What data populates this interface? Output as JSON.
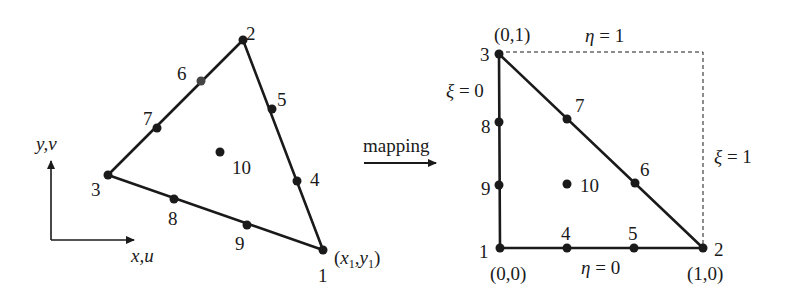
{
  "diagram": {
    "colors": {
      "ink": "#1a1a1a",
      "background": "#ffffff"
    },
    "physical_element": {
      "axes": {
        "y_label": "y,v",
        "x_label": "x,u"
      },
      "corner_label": {
        "prefix": "(",
        "x": "x",
        "x_sub": "1",
        "sep": ",",
        "y": "y",
        "y_sub": "1",
        "suffix": ")"
      },
      "nodes": [
        {
          "id": "1",
          "label": "1",
          "x": 323,
          "y": 250
        },
        {
          "id": "2",
          "label": "2",
          "x": 243,
          "y": 40
        },
        {
          "id": "3",
          "label": "3",
          "x": 108,
          "y": 175
        },
        {
          "id": "4",
          "label": "4",
          "x": 297,
          "y": 181
        },
        {
          "id": "5",
          "label": "5",
          "x": 272,
          "y": 109
        },
        {
          "id": "6",
          "label": "6",
          "x": 201,
          "y": 81
        },
        {
          "id": "7",
          "label": "7",
          "x": 157,
          "y": 128
        },
        {
          "id": "8",
          "label": "8",
          "x": 174,
          "y": 199
        },
        {
          "id": "9",
          "label": "9",
          "x": 247,
          "y": 225
        },
        {
          "id": "10",
          "label": "10",
          "x": 220,
          "y": 152
        }
      ]
    },
    "mapping": {
      "label": "mapping"
    },
    "reference_element": {
      "nodes": [
        {
          "id": "1",
          "label": "1",
          "x": 500,
          "y": 248
        },
        {
          "id": "2",
          "label": "2",
          "x": 703,
          "y": 248
        },
        {
          "id": "3",
          "label": "3",
          "x": 499,
          "y": 54
        },
        {
          "id": "4",
          "label": "4",
          "x": 567,
          "y": 248
        },
        {
          "id": "5",
          "label": "5",
          "x": 634,
          "y": 248
        },
        {
          "id": "6",
          "label": "6",
          "x": 635,
          "y": 183
        },
        {
          "id": "7",
          "label": "7",
          "x": 567,
          "y": 119
        },
        {
          "id": "8",
          "label": "8",
          "x": 499,
          "y": 122
        },
        {
          "id": "9",
          "label": "9",
          "x": 499,
          "y": 185
        },
        {
          "id": "10",
          "label": "10",
          "x": 567,
          "y": 184
        }
      ],
      "coordinates": {
        "origin": "(0,0)",
        "node2": "(1,0)",
        "node3": "(0,1)"
      },
      "edge_labels": {
        "eta_top": {
          "symbol": "η",
          "eq": " = 1"
        },
        "eta_bottom": {
          "symbol": "η",
          "eq": " = 0"
        },
        "xi_left": {
          "symbol": "ξ",
          "eq": " = 0"
        },
        "xi_right": {
          "symbol": "ξ",
          "eq": " = 1"
        }
      }
    }
  }
}
